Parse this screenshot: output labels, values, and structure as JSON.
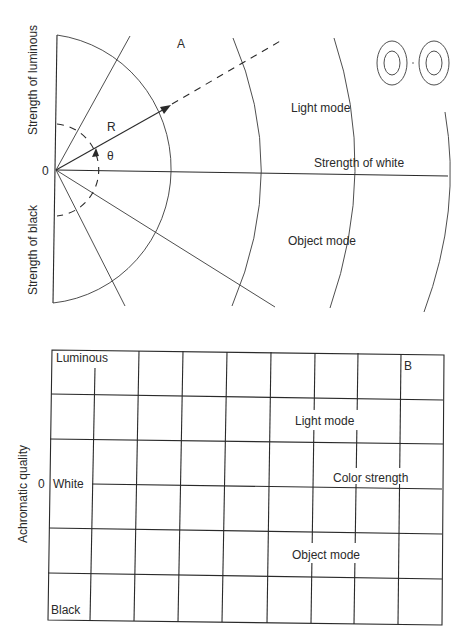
{
  "panel_a": {
    "letter": "A",
    "y_axis_top_label": "Strength of luminous",
    "y_axis_bottom_label": "Strength of black",
    "origin_label": "0",
    "radius_label": "R",
    "angle_label": "θ",
    "x_axis_label": "Strength of white",
    "upper_region_label": "Light mode",
    "lower_region_label": "Object mode"
  },
  "panel_b": {
    "letter": "B",
    "y_axis_label": "Achromatic quality",
    "origin_label": "0",
    "top_label": "Luminous",
    "middle_label": "White",
    "bottom_label": "Black",
    "upper_region_label": "Light mode",
    "axis_label": "Color strength",
    "lower_region_label": "Object mode",
    "grid_columns": 9,
    "grid_rows": 6
  }
}
